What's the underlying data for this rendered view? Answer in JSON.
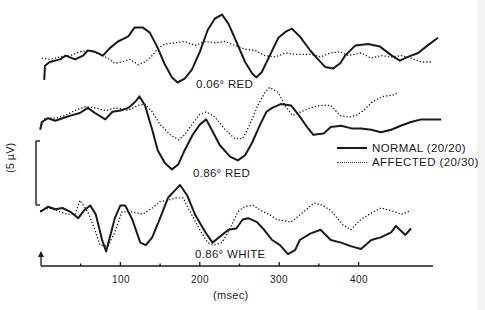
{
  "chart_data": {
    "type": "line",
    "title": "",
    "xlabel": "(msec)",
    "ylabel": "(5 µV)",
    "x_ticks": [
      {
        "value": 50,
        "label": ""
      },
      {
        "value": 100,
        "label": "100"
      },
      {
        "value": 150,
        "label": ""
      },
      {
        "value": 200,
        "label": "200"
      },
      {
        "value": 250,
        "label": ""
      },
      {
        "value": 300,
        "label": "300"
      },
      {
        "value": 350,
        "label": ""
      },
      {
        "value": 400,
        "label": "400"
      }
    ],
    "xlim": [
      0,
      495
    ],
    "scale_bar": {
      "label": "(5 µV)",
      "value_uV": 5
    },
    "grid": false,
    "legend_position": "right-middle",
    "legend": [
      {
        "name": "NORMAL (20/20)",
        "style": "solid"
      },
      {
        "name": "AFFECTED (20/30)",
        "style": "dotted"
      }
    ],
    "panels": [
      {
        "label": "0.06° RED",
        "series": [
          {
            "name": "NORMAL (20/20)",
            "style": "solid",
            "ms": [
              4,
              5,
              11,
              24,
              31,
              43,
              53,
              59,
              68,
              78,
              87,
              97,
              110,
              118,
              128,
              137,
              147,
              156,
              165,
              172,
              181,
              190,
              200,
              210,
              219,
              228,
              236,
              246,
              257,
              266,
              271,
              278,
              288,
              299,
              309,
              316,
              326,
              339,
              349,
              358,
              368,
              377,
              383,
              396,
              412,
              427,
              442,
              452,
              462,
              475,
              487,
              500
            ],
            "uV": [
              -1.4,
              -0.3,
              0,
              0.2,
              0.5,
              0.2,
              0.5,
              0.9,
              0.8,
              0.5,
              1.1,
              1.6,
              2.0,
              2.7,
              2.7,
              2.3,
              1.1,
              -0.2,
              -1.2,
              -1.6,
              -1.3,
              -0.6,
              0.8,
              2.5,
              3.4,
              3.7,
              3.0,
              1.6,
              0,
              -0.9,
              -1.2,
              -0.8,
              0.5,
              1.9,
              2.4,
              2.6,
              2.0,
              0.9,
              0.2,
              -0.4,
              -0.5,
              -0.1,
              0.5,
              1.3,
              1.4,
              1.2,
              0.5,
              0.1,
              0.4,
              0.7,
              1.3,
              1.9
            ]
          },
          {
            "name": "AFFECTED (20/30)",
            "style": "dotted",
            "ms": [
              1,
              11,
              24,
              37,
              49,
              62,
              74,
              84,
              93,
              102,
              112,
              122,
              131,
              140,
              148,
              156,
              169,
              181,
              194,
              207,
              219,
              232,
              244,
              257,
              270,
              282,
              295,
              308,
              320,
              339,
              352,
              364,
              377,
              387,
              403,
              416,
              428,
              441,
              454,
              466,
              479,
              491
            ],
            "uV": [
              0.3,
              0.2,
              0.4,
              0.5,
              0.8,
              0.9,
              0.6,
              0.3,
              -0.1,
              0,
              0.2,
              -0.2,
              0,
              0.5,
              1.1,
              1.4,
              1.5,
              1.6,
              1.3,
              1.6,
              1.5,
              1.6,
              1.3,
              1.0,
              0.9,
              0.5,
              0.4,
              0.7,
              0.6,
              0.6,
              0.4,
              0.7,
              0.8,
              0.5,
              0.7,
              0.3,
              0.5,
              0.4,
              0.5,
              0.3,
              0,
              0
            ]
          }
        ]
      },
      {
        "label": "0.86° RED",
        "series": [
          {
            "name": "NORMAL (20/20)",
            "style": "solid",
            "ms": [
              -1,
              1,
              9,
              18,
              27,
              37,
              49,
              59,
              68,
              81,
              90,
              100,
              110,
              119,
              124,
              131,
              140,
              147,
              156,
              165,
              173,
              181,
              191,
              200,
              208,
              215,
              225,
              238,
              248,
              257,
              266,
              276,
              284,
              291,
              302,
              315,
              325,
              334,
              343,
              356,
              365,
              378,
              391,
              403,
              416,
              428,
              441,
              453,
              466,
              479,
              491,
              504
            ],
            "uV": [
              -0.6,
              0,
              0.3,
              0.1,
              0.3,
              0.5,
              0.7,
              1.1,
              0.7,
              0.2,
              0.8,
              0.9,
              1.1,
              1.6,
              2.0,
              1.3,
              -0.6,
              -2.2,
              -3.2,
              -3.7,
              -3.3,
              -2.2,
              -1.0,
              -0.2,
              0.2,
              -0.6,
              -1.8,
              -2.7,
              -3.0,
              -2.6,
              -1.6,
              -0.2,
              0.8,
              1.1,
              1.4,
              1.3,
              0.5,
              -0.3,
              -1.0,
              -0.9,
              -0.4,
              -0.3,
              -0.5,
              -0.5,
              -0.6,
              -0.8,
              -0.6,
              -0.3,
              0,
              0.2,
              0.2,
              0.2
            ]
          },
          {
            "name": "AFFECTED (20/30)",
            "style": "dotted",
            "ms": [
              -1,
              5,
              18,
              30,
              43,
              56,
              68,
              81,
              94,
              110,
              122,
              131,
              140,
              150,
              163,
              173,
              181,
              191,
              200,
              208,
              219,
              232,
              244,
              254,
              263,
              273,
              282,
              288,
              299,
              308,
              317,
              327,
              339,
              352,
              365,
              377,
              388,
              397,
              406,
              418,
              431,
              443,
              450
            ],
            "uV": [
              -0.5,
              0.3,
              0.3,
              0.5,
              0.9,
              1.2,
              1.1,
              0.9,
              1.1,
              0.9,
              1.3,
              1.4,
              0.8,
              -0.2,
              -1.0,
              -1.4,
              -1.0,
              -0.1,
              0.6,
              0.8,
              0.4,
              -0.6,
              -1.3,
              -1.3,
              -0.2,
              1.3,
              2.3,
              2.7,
              2.3,
              1.2,
              0.5,
              0.8,
              1.1,
              1.3,
              1.3,
              0.5,
              0.4,
              0.5,
              0.9,
              1.6,
              2.0,
              2.1,
              2.3
            ]
          }
        ]
      },
      {
        "label": "0.86° WHITE",
        "series": [
          {
            "name": "NORMAL (20/20)",
            "style": "solid",
            "ms": [
              -1,
              9,
              18,
              27,
              37,
              47,
              54,
              62,
              69,
              77,
              82,
              87,
              93,
              100,
              106,
              115,
              125,
              132,
              140,
              150,
              160,
              169,
              175,
              184,
              194,
              207,
              216,
              226,
              236,
              246,
              254,
              261,
              272,
              281,
              291,
              301,
              311,
              320,
              326,
              339,
              352,
              365,
              378,
              391,
              403,
              416,
              428,
              441,
              447,
              459,
              466
            ],
            "uV": [
              -0.3,
              0.1,
              -0.1,
              0,
              -0.3,
              -0.8,
              -0.2,
              0.2,
              -0.5,
              -2.5,
              -3.4,
              -2.2,
              -0.8,
              0.2,
              0.2,
              -0.9,
              -2.7,
              -2.9,
              -2.3,
              -0.8,
              0.8,
              1.4,
              1.8,
              1.0,
              -0.5,
              -1.9,
              -2.7,
              -2.2,
              -1.7,
              -1.6,
              -0.9,
              -0.8,
              -1.1,
              -1.7,
              -2.5,
              -2.9,
              -3.6,
              -3.3,
              -2.5,
              -2.0,
              -1.7,
              -2.5,
              -2.7,
              -3.0,
              -3.2,
              -2.5,
              -2.3,
              -1.9,
              -1.4,
              -2.1,
              -1.6
            ]
          },
          {
            "name": "AFFECTED (20/30)",
            "style": "dotted",
            "ms": [
              -1,
              11,
              24,
              34,
              43,
              49,
              59,
              68,
              74,
              84,
              93,
              102,
              115,
              128,
              140,
              150,
              160,
              170,
              179,
              187,
              200,
              210,
              218,
              228,
              238,
              248,
              256,
              267,
              277,
              287,
              297,
              315,
              327,
              344,
              355,
              365,
              380,
              390,
              403,
              416,
              428,
              441,
              454,
              466
            ],
            "uV": [
              -0.2,
              0,
              -0.3,
              -0.5,
              -0.5,
              0.6,
              -0.3,
              -1.7,
              -2.9,
              -3.0,
              -1.9,
              -0.3,
              -0.3,
              -0.5,
              0,
              0.5,
              0.6,
              0.8,
              0.8,
              -0.2,
              -1.7,
              -2.7,
              -2.9,
              -2.7,
              -1.6,
              -0.3,
              0.1,
              0.2,
              -0.2,
              -0.5,
              -0.9,
              -1.1,
              -0.5,
              0.4,
              0.2,
              -0.2,
              -1.3,
              -1.7,
              -0.9,
              -0.4,
              0,
              -0.2,
              -0.5,
              -0.2
            ]
          }
        ]
      }
    ]
  },
  "labels": {
    "panel_1": "0.06° RED",
    "panel_2": "0.86° RED",
    "panel_3": "0.86° WHITE",
    "x_axis_title": "(msec)",
    "scale_bar": "(5 µV)",
    "tick_100": "100",
    "tick_200": "200",
    "tick_300": "300",
    "tick_400": "400",
    "legend_normal": "NORMAL (20/20)",
    "legend_affected": "AFFECTED (20/30)"
  },
  "layout": {
    "ink_color": "#1a1a1a",
    "x0_px": 41,
    "px_per_ms": 0.794,
    "px_per_uV": 12.8,
    "baselines_px": [
      62,
      122,
      208
    ],
    "axis_y_px": 266,
    "axis_end_px": 433
  }
}
